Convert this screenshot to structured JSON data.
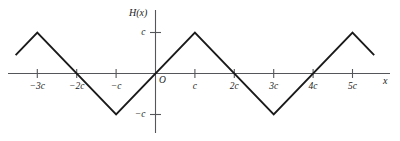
{
  "figure": {
    "background_color": "#ffffff",
    "curve_color": "#1a1a1a",
    "axis_color": "#55565a",
    "text_color": "#1a1a1a"
  },
  "axes": {
    "y_axis_label": "H(x)",
    "x_axis_label": "x",
    "origin_label": "O",
    "x_ticks": [
      {
        "label": "−3c",
        "value": -3
      },
      {
        "label": "−2c",
        "value": -2
      },
      {
        "label": "−c",
        "value": -1
      },
      {
        "label": "c",
        "value": 1
      },
      {
        "label": "2c",
        "value": 2
      },
      {
        "label": "3c",
        "value": 3
      },
      {
        "label": "4c",
        "value": 4
      },
      {
        "label": "5c",
        "value": 5
      }
    ],
    "y_ticks": [
      {
        "label": "c",
        "value": 1
      },
      {
        "label": "−c",
        "value": -1
      }
    ]
  },
  "chart_data": {
    "type": "line",
    "title": "",
    "subtitle": "",
    "xlabel": "x",
    "ylabel": "H(x)",
    "grid": false,
    "legend": "none",
    "xlim": [
      -3.55,
      5.6
    ],
    "ylim": [
      -1.35,
      1.5
    ],
    "x_tick_labels": [
      "−3c",
      "−2c",
      "−c",
      "c",
      "2c",
      "3c",
      "4c",
      "5c"
    ],
    "x_tick_values": [
      -3,
      -2,
      -1,
      1,
      2,
      3,
      4,
      5
    ],
    "y_tick_labels": [
      "c",
      "−c"
    ],
    "y_tick_values": [
      1,
      -1
    ],
    "period": 4,
    "amplitude": 1,
    "series": [
      {
        "name": "H(x)",
        "x": [
          -3.55,
          -3,
          -1,
          1,
          3,
          5,
          5.55
        ],
        "values": [
          0.45,
          1,
          -1,
          1,
          -1,
          1,
          0.45
        ]
      }
    ]
  }
}
